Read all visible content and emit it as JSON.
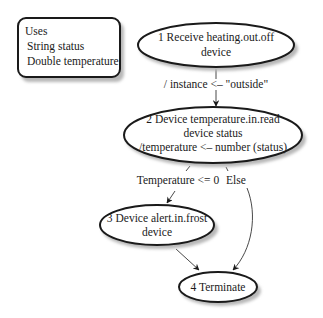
{
  "header": {
    "cropped_caption": ""
  },
  "uses_box": {
    "title": "Uses",
    "lines": [
      "String status",
      "Double temperature"
    ]
  },
  "nodes": [
    {
      "id": "1",
      "lines": [
        "1 Receive heating.out.off",
        "device"
      ]
    },
    {
      "id": "2",
      "lines": [
        "2 Device temperature.in.read",
        "device status",
        "/temperature <– number (status)"
      ]
    },
    {
      "id": "3",
      "lines": [
        "3 Device alert.in.frost",
        "device"
      ]
    },
    {
      "id": "4",
      "lines": [
        "4 Terminate"
      ]
    }
  ],
  "edges": [
    {
      "from": "1",
      "to": "2",
      "label": "/ instance <– \"outside\""
    },
    {
      "from": "2",
      "to": "3",
      "label": "Temperature <= 0"
    },
    {
      "from": "2",
      "to": "4",
      "label": "Else"
    },
    {
      "from": "3",
      "to": "4",
      "label": ""
    }
  ],
  "colors": {
    "stroke": "#1a1a1a",
    "shadow": "#b8b8b8",
    "text": "#1a1a1a"
  }
}
